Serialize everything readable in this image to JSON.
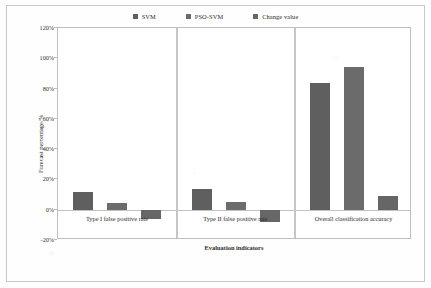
{
  "chart_data": {
    "type": "bar",
    "title": "",
    "xlabel": "Evaluation indicators",
    "ylabel": "Forecast percentage/%",
    "categories": [
      "Type I false positive rate",
      "Type II false positive rate",
      "Overall classification accuracy"
    ],
    "series": [
      {
        "name": "SVM",
        "color": "#5f5f5f",
        "values": [
          12,
          14,
          84
        ]
      },
      {
        "name": "PSO-SVM",
        "color": "#6b6b6b",
        "values": [
          4.5,
          5,
          94
        ]
      },
      {
        "name": "Change value",
        "color": "#666666",
        "values": [
          -6,
          -8,
          9
        ]
      }
    ],
    "ylim": [
      -20,
      120
    ],
    "ytick_labels": [
      "120%",
      "100%",
      "80%",
      "60%",
      "40%",
      "20%",
      "0%",
      "-20%"
    ],
    "ytick_values": [
      120,
      100,
      80,
      60,
      40,
      20,
      0,
      -20
    ],
    "grid": false,
    "legend_position": "top",
    "value_suffix": "%"
  },
  "legend": {
    "items": [
      {
        "label": "SVM",
        "swatch": "legend-swatch-svm"
      },
      {
        "label": "PSO-SVM",
        "swatch": "legend-swatch-pso-svm"
      },
      {
        "label": "Change value",
        "swatch": "legend-swatch-change-value"
      }
    ]
  },
  "axes": {
    "y_title": "Forecast percentage/%",
    "x_title": "Evaluation indicators"
  }
}
